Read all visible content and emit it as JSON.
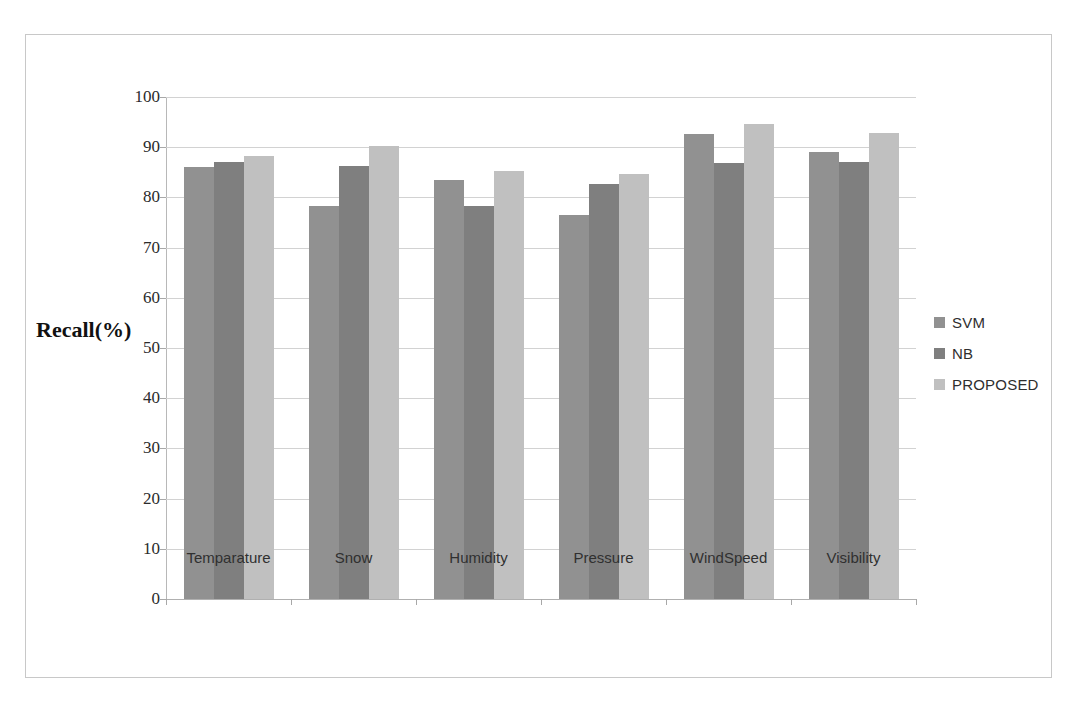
{
  "chart_data": {
    "type": "bar",
    "title": "",
    "xlabel": "",
    "ylabel": "Recall(%)",
    "ylim": [
      0,
      100
    ],
    "ytick_step": 10,
    "yticks": [
      0,
      10,
      20,
      30,
      40,
      50,
      60,
      70,
      80,
      90,
      100
    ],
    "grid": true,
    "legend_position": "right",
    "categories": [
      "Temparature",
      "Snow",
      "Humidity",
      "Pressure",
      "WindSpeed",
      "Visibility"
    ],
    "series": [
      {
        "name": "SVM",
        "color": "#919191",
        "values": [
          86.1,
          78.2,
          83.4,
          76.4,
          92.6,
          89.0
        ]
      },
      {
        "name": "NB",
        "color": "#7f7f7f",
        "values": [
          87.0,
          86.3,
          78.3,
          82.6,
          86.9,
          87.0
        ]
      },
      {
        "name": "PROPOSED",
        "color": "#c0c0c0",
        "values": [
          88.2,
          90.3,
          85.3,
          84.6,
          94.7,
          92.8
        ]
      }
    ]
  },
  "figure": {
    "border_color": "#c8c8c8",
    "background": "#ffffff"
  }
}
